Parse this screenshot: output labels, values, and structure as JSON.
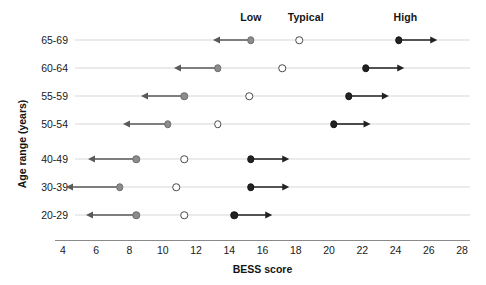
{
  "chart_data": {
    "type": "scatter",
    "title": "",
    "xlabel": "BESS score",
    "ylabel": "Age range (years)",
    "xlim": [
      4,
      28
    ],
    "xticks": [
      4,
      6,
      8,
      10,
      12,
      14,
      16,
      18,
      20,
      22,
      24,
      26,
      28
    ],
    "grid": false,
    "legend_position": "top",
    "categories": [
      "65-69",
      "60-64",
      "55-59",
      "50-54",
      "40-49",
      "30-39",
      "20-29"
    ],
    "series": [
      {
        "name": "Low",
        "marker": "gray-filled-circle",
        "color": "#8c8c8c",
        "direction": "left",
        "values": [
          15.3,
          13.3,
          11.3,
          10.3,
          8.4,
          7.4,
          8.4
        ],
        "arrow_ends": [
          13.0,
          10.7,
          8.7,
          7.6,
          5.5,
          4.2,
          5.4
        ]
      },
      {
        "name": "Typical",
        "marker": "open-circle",
        "color": "#ffffff",
        "direction": "none",
        "values": [
          18.2,
          17.2,
          15.2,
          13.3,
          11.3,
          10.8,
          11.3
        ],
        "arrow_ends": [
          null,
          null,
          null,
          null,
          null,
          null,
          null
        ]
      },
      {
        "name": "High",
        "marker": "black-filled-circle",
        "color": "#222222",
        "direction": "right",
        "values": [
          24.2,
          22.2,
          21.2,
          20.3,
          15.3,
          15.3,
          14.3
        ],
        "arrow_ends": [
          26.5,
          24.5,
          23.6,
          22.5,
          17.6,
          17.6,
          16.6
        ]
      }
    ],
    "header_labels": [
      {
        "text": "Low",
        "x": 15.3
      },
      {
        "text": "Typical",
        "x": 18.6
      },
      {
        "text": "High",
        "x": 24.6
      }
    ]
  }
}
